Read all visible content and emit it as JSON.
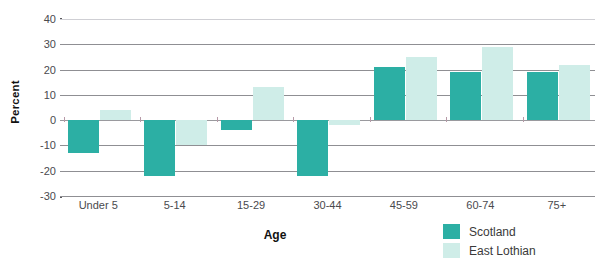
{
  "chart_data": {
    "type": "bar",
    "title": "",
    "xlabel": "Age",
    "ylabel": "Percent",
    "ylim": [
      -30,
      40
    ],
    "ytick_labels": [
      "40",
      "30",
      "20",
      "10",
      "0",
      "-10",
      "-20",
      "-30"
    ],
    "yticks": [
      40,
      30,
      20,
      10,
      0,
      -10,
      -20,
      -30
    ],
    "grid": true,
    "legend_position": "bottom-right",
    "categories": [
      "Under 5",
      "5-14",
      "15-29",
      "30-44",
      "45-59",
      "60-74",
      "75+"
    ],
    "series": [
      {
        "name": "Scotland",
        "color": "#2CAFA4",
        "values": [
          -13,
          -22,
          -4,
          -22,
          21,
          19,
          19
        ]
      },
      {
        "name": "East Lothian",
        "color": "#CFEDE8",
        "values": [
          4,
          -10,
          13,
          -2,
          25,
          29,
          22
        ]
      }
    ]
  },
  "legend": {
    "items": [
      {
        "label": "Scotland",
        "color": "#2CAFA4"
      },
      {
        "label": "East Lothian",
        "color": "#CFEDE8"
      }
    ]
  },
  "axes": {
    "y_title": "Percent",
    "x_title": "Age"
  },
  "title_strip": ""
}
